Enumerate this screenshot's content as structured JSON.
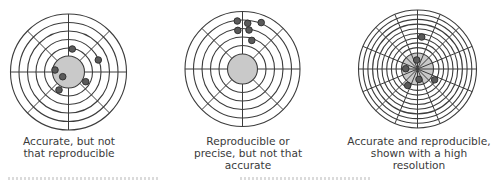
{
  "figure": {
    "style": {
      "line_color": "#3c3c3c",
      "bullseye_fill": "#c9c9c9",
      "dot_fill": "#5a5a5a",
      "dot_stroke": "#2a2a2a",
      "caption_color": "#3a3a3a"
    },
    "targets": [
      {
        "id": "accurate-not-reproducible",
        "cx": 68.5,
        "cy": 72,
        "ring_radii": [
          58,
          49.5,
          41,
          32.5,
          24
        ],
        "bullseye_radius": 16,
        "spokes": 8,
        "spokes_through_center": false,
        "dots": [
          {
            "x": 72.3,
            "y": 49
          },
          {
            "x": 98.3,
            "y": 60
          },
          {
            "x": 55,
            "y": 70
          },
          {
            "x": 62.7,
            "y": 76.7
          },
          {
            "x": 85.7,
            "y": 81.7
          },
          {
            "x": 59,
            "y": 90
          }
        ],
        "caption": {
          "lines": [
            "Accurate, but not",
            "that reproducible"
          ],
          "center_x": 69,
          "top": 135
        }
      },
      {
        "id": "precise-not-accurate",
        "cx": 242.5,
        "cy": 69,
        "ring_radii": [
          57.5,
          49,
          40.5,
          32,
          23.5
        ],
        "bullseye_radius": 15,
        "spokes": 8,
        "spokes_through_center": false,
        "dots": [
          {
            "x": 237.3,
            "y": 21
          },
          {
            "x": 247.7,
            "y": 23.3
          },
          {
            "x": 261.2,
            "y": 22.6
          },
          {
            "x": 237.8,
            "y": 30.4
          },
          {
            "x": 249,
            "y": 30
          },
          {
            "x": 251.8,
            "y": 40.4
          }
        ],
        "caption": {
          "lines": [
            "Reproducible or",
            "precise, but not that",
            "accurate"
          ],
          "center_x": 248,
          "top": 135
        }
      },
      {
        "id": "accurate-and-reproducible-high-resolution",
        "cx": 417.5,
        "cy": 69,
        "ring_radii": [
          59,
          54.3,
          49.6,
          44.9,
          40.2,
          35.5,
          30.8,
          26.1,
          21.4
        ],
        "bullseye_radius": 16,
        "spokes": 16,
        "spokes_through_center": true,
        "dots": [
          {
            "x": 421.7,
            "y": 37
          },
          {
            "x": 416.7,
            "y": 60
          },
          {
            "x": 405.7,
            "y": 68.7
          },
          {
            "x": 419,
            "y": 79.4
          },
          {
            "x": 434.6,
            "y": 79.8
          },
          {
            "x": 407.7,
            "y": 85.5
          }
        ],
        "caption": {
          "lines": [
            "Accurate and reproducible,",
            "shown with a high",
            "resolution"
          ],
          "center_x": 419,
          "top": 135
        }
      }
    ]
  }
}
